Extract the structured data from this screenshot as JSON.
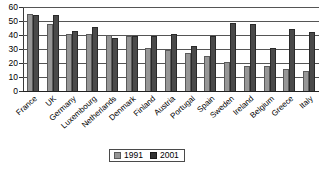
{
  "chart_data": {
    "type": "bar",
    "title": "",
    "subtitle": "",
    "xlabel": "",
    "ylabel": "",
    "ylim": [
      0,
      60
    ],
    "ytick_step": 10,
    "ytick_labels": [
      "60",
      "50",
      "40",
      "30",
      "20",
      "10",
      "0"
    ],
    "grid": true,
    "grid_orientation": "horizontal",
    "legend_position": "bottom-center",
    "categories": [
      "France",
      "UK",
      "Germany",
      "Luxembourg",
      "Netherlands",
      "Denmark",
      "Finland",
      "Austria",
      "Portugal",
      "Spain",
      "Sweden",
      "Ireland",
      "Belgium",
      "Greece",
      "Italy"
    ],
    "series": [
      {
        "name": "1991",
        "color": "#969696",
        "values": [
          55,
          48,
          41,
          41,
          40,
          39.5,
          31,
          29,
          27.5,
          25,
          20.5,
          18,
          18,
          16,
          14
        ]
      },
      {
        "name": "2001",
        "color": "#4a4a4a",
        "values": [
          54,
          54,
          43,
          46,
          38,
          39,
          39.5,
          41,
          32,
          39,
          48.5,
          48,
          31,
          44,
          42
        ]
      }
    ]
  },
  "legend": {
    "items": [
      {
        "label": "1991"
      },
      {
        "label": "2001"
      }
    ]
  }
}
